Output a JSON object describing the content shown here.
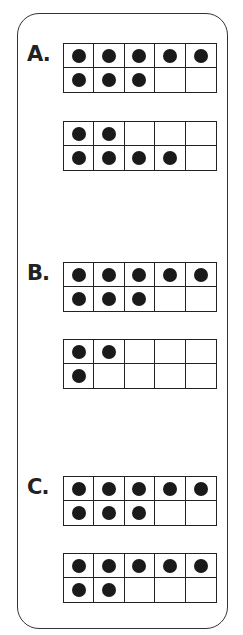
{
  "problems": [
    {
      "label": "A.",
      "frames": [
        {
          "filled": [
            true,
            true,
            true,
            true,
            true,
            true,
            true,
            true,
            false,
            false
          ],
          "count": 8
        },
        {
          "filled": [
            true,
            true,
            false,
            false,
            false,
            true,
            true,
            true,
            true,
            false
          ],
          "count": 6
        }
      ]
    },
    {
      "label": "B.",
      "frames": [
        {
          "filled": [
            true,
            true,
            true,
            true,
            true,
            true,
            true,
            true,
            false,
            false
          ],
          "count": 8
        },
        {
          "filled": [
            true,
            true,
            false,
            false,
            false,
            true,
            false,
            false,
            false,
            false
          ],
          "count": 3
        }
      ]
    },
    {
      "label": "C.",
      "frames": [
        {
          "filled": [
            true,
            true,
            true,
            true,
            true,
            true,
            true,
            true,
            false,
            false
          ],
          "count": 8
        },
        {
          "filled": [
            true,
            true,
            true,
            true,
            true,
            true,
            true,
            false,
            false,
            false
          ],
          "count": 7
        }
      ]
    }
  ],
  "colors": {
    "dot": "#1a1a1a",
    "line": "#222222",
    "background": "#ffffff"
  }
}
